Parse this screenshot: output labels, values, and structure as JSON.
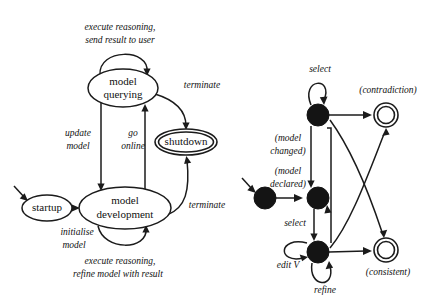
{
  "figure": {
    "kind": "state-transition-diagram-pair",
    "background_color": "#ffffff",
    "ink_color": "#1b1b1b"
  },
  "left_diagram": {
    "name": "model lifecycle statechart",
    "states": [
      {
        "id": "startup",
        "label": "startup",
        "shape": "ellipse",
        "cx": 47,
        "cy": 208,
        "rx": 25,
        "ry": 13
      },
      {
        "id": "model_querying",
        "label_line1": "model",
        "label_line2": "querying",
        "shape": "ellipse",
        "cx": 123,
        "cy": 88,
        "rx": 35,
        "ry": 19
      },
      {
        "id": "model_development",
        "label_line1": "model",
        "label_line2": "development",
        "shape": "ellipse",
        "cx": 125,
        "cy": 208,
        "rx": 46,
        "ry": 21
      },
      {
        "id": "shutdown",
        "label": "shutdown",
        "shape": "double-ellipse",
        "cx": 186,
        "cy": 142,
        "rx": 31,
        "ry": 12
      }
    ],
    "transitions": [
      {
        "id": "initialise",
        "label": "initialise\nmodel",
        "from": "startup",
        "to": "model_development"
      },
      {
        "id": "self_query",
        "label_line1": "execute reasoning,",
        "label_line2": "send result to user",
        "from": "model_querying",
        "to": "model_querying"
      },
      {
        "id": "update_model",
        "label_line1": "update",
        "label_line2": "model",
        "from": "model_querying",
        "to": "model_development"
      },
      {
        "id": "go_online",
        "label_line1": "go",
        "label_line2": "online",
        "from": "model_development",
        "to": "model_querying"
      },
      {
        "id": "terminate_query",
        "label": "terminate",
        "from": "model_querying",
        "to": "shutdown"
      },
      {
        "id": "terminate_dev",
        "label": "terminate",
        "from": "model_development",
        "to": "shutdown"
      },
      {
        "id": "self_dev",
        "label_line1": "execute reasoning,",
        "label_line2": "refine model with result",
        "from": "model_development",
        "to": "model_development"
      }
    ],
    "labels": {
      "execute_send_l1": "execute reasoning,",
      "execute_send_l2": "send result to user",
      "update_l1": "update",
      "update_l2": "model",
      "go_l1": "go",
      "go_l2": "online",
      "terminate_top": "terminate",
      "terminate_bottom": "terminate",
      "initialise_l1": "initialise",
      "initialise_l2": "model",
      "execute_refine_l1": "execute reasoning,",
      "execute_refine_l2": "refine model with result"
    },
    "node_text": {
      "startup": "startup",
      "shutdown": "shutdown",
      "querying_l1": "model",
      "querying_l2": "querying",
      "development_l1": "model",
      "development_l2": "development"
    }
  },
  "right_diagram": {
    "name": "model editing statechart",
    "states": [
      {
        "id": "initial",
        "shape": "filled-circle",
        "cx": 265,
        "cy": 198,
        "r": 11
      },
      {
        "id": "declared",
        "shape": "filled-circle",
        "cx": 318,
        "cy": 198,
        "r": 11
      },
      {
        "id": "selected_top",
        "shape": "filled-circle",
        "cx": 318,
        "cy": 115,
        "r": 11
      },
      {
        "id": "editing",
        "shape": "filled-circle",
        "cx": 318,
        "cy": 252,
        "r": 11
      },
      {
        "id": "contradiction",
        "shape": "double-circle",
        "cx": 386,
        "cy": 115,
        "r_outer": 12,
        "r_inner": 9
      },
      {
        "id": "consistent",
        "shape": "double-circle",
        "cx": 386,
        "cy": 250,
        "r_outer": 12,
        "r_inner": 9
      }
    ],
    "labels": {
      "select_top": "select",
      "contradiction": "(contradiction)",
      "model_changed_l1": "(model",
      "model_changed_l2": "changed)",
      "model_declared_l1": "(model",
      "model_declared_l2": "declared)",
      "select_mid": "select",
      "edit_v": "edit V",
      "refine": "refine",
      "consistent": "(consistent)"
    },
    "transitions": [
      {
        "id": "entry",
        "label": "",
        "from": "external",
        "to": "initial"
      },
      {
        "id": "model_declared",
        "label": "(model declared)",
        "from": "initial",
        "to": "declared"
      },
      {
        "id": "select_down",
        "label": "select",
        "from": "declared",
        "to": "editing"
      },
      {
        "id": "model_changed",
        "label": "(model changed)",
        "from": "selected_top",
        "to": "declared"
      },
      {
        "id": "self_select",
        "label": "select",
        "from": "selected_top",
        "to": "selected_top"
      },
      {
        "id": "to_contradiction",
        "label": "(contradiction)",
        "from": "selected_top",
        "to": "contradiction"
      },
      {
        "id": "edit_v_self",
        "label": "edit V",
        "from": "editing",
        "to": "editing"
      },
      {
        "id": "refine_self",
        "label": "refine",
        "from": "editing",
        "to": "editing"
      },
      {
        "id": "to_consistent",
        "label": "(consistent)",
        "from": "editing",
        "to": "consistent"
      },
      {
        "id": "editing_up",
        "label": "",
        "from": "editing",
        "to": "declared"
      },
      {
        "id": "cross_to_consistent",
        "label": "",
        "from": "selected_top",
        "to": "consistent"
      },
      {
        "id": "cross_to_contradiction",
        "label": "",
        "from": "editing",
        "to": "contradiction"
      }
    ]
  }
}
